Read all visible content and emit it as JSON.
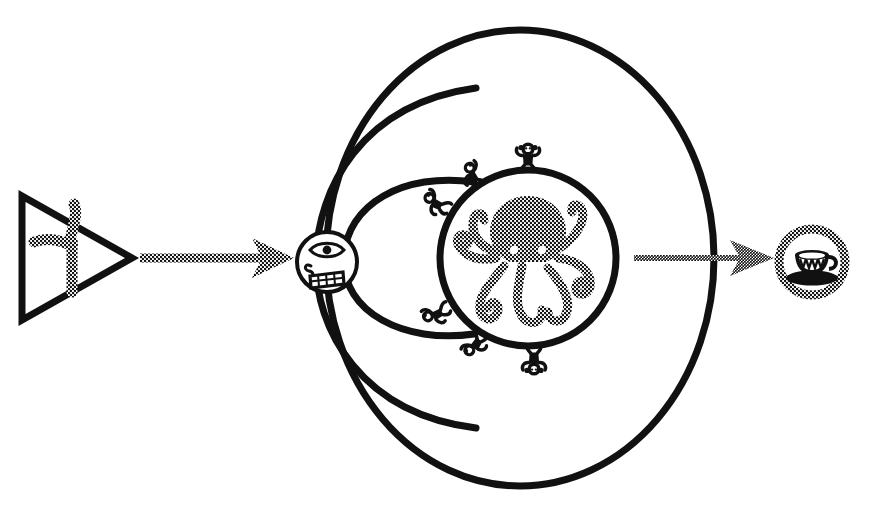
{
  "canvas": {
    "width": 874,
    "height": 520,
    "background_color": "#ffffff",
    "ink_color": "#111111",
    "style": "black-and-white line art with halftone dither fills"
  },
  "diagram": {
    "title": "",
    "flow_direction": "left-to-right",
    "nodes": [
      {
        "id": "triangle-source",
        "label": "",
        "shape": "triangle-outline",
        "contains": "three-pointed-propeller-glyph",
        "fill": "halftone-dither",
        "center_x": 72,
        "center_y": 258
      },
      {
        "id": "face-circle",
        "label": "",
        "shape": "circle-outline",
        "contains": "one-eyed-grinning-face",
        "features": [
          "single-almond-eye",
          "spiral-nose",
          "grid-tooth-mouth"
        ],
        "center_x": 327,
        "center_y": 262,
        "radius": 30
      },
      {
        "id": "octopus-sphere",
        "label": "",
        "shape": "thick-circle-outline",
        "contains": "octopus-glyph",
        "fill": "halftone-dither",
        "center_x": 528,
        "center_y": 258,
        "radius": 88
      },
      {
        "id": "teacup-target",
        "label": "",
        "shape": "dithered-ring",
        "contains": "teacup-and-saucer-glyph",
        "center_x": 812,
        "center_y": 262,
        "radius": 33
      }
    ],
    "arrows": [
      {
        "id": "arrow-left",
        "from": "triangle-source",
        "to": "face-circle",
        "style": "halftone-checkered-shaft-solid-head",
        "x1": 140,
        "x2": 292,
        "y": 258
      },
      {
        "id": "arrow-right",
        "from": "octopus-sphere",
        "to": "teacup-target",
        "style": "halftone-checkered-shaft-and-head",
        "x1": 632,
        "x2": 772,
        "y": 258
      }
    ],
    "orbits": [
      {
        "id": "orbit-outer",
        "type": "closed-ellipse",
        "rx": 194,
        "ry": 228
      },
      {
        "id": "orbit-middle",
        "type": "open-arc",
        "rx": 160,
        "ry": 172
      },
      {
        "id": "orbit-inner",
        "type": "open-arc",
        "rx": 122,
        "ry": 110
      }
    ],
    "orbit_center": {
      "x": 520,
      "y": 258
    },
    "satellites": {
      "glyph": "monkey-figure",
      "count": 6,
      "positions_deg": [
        -90,
        -125,
        -158,
        90,
        125,
        158
      ]
    }
  }
}
